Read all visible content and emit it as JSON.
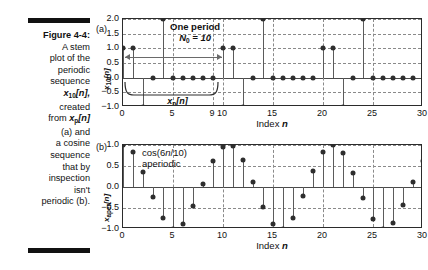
{
  "figure": {
    "caption_label": "Figure 4-4:",
    "caption_text": "A stem plot of the periodic sequence x10[n], created from xp[n] (a) and a cosine sequence that by inspection isn't periodic (b).",
    "caption_lines": [
      "A stem",
      "plot of the",
      "periodic",
      "sequence",
      "created",
      "(a) and",
      "a cosine",
      "sequence",
      "that by",
      "inspection",
      "isn't",
      "periodic (b)."
    ],
    "rule_color": "#111111"
  },
  "panel_a": {
    "tag": "(a)",
    "ylabel": "x10[n]",
    "ylabel_base": "x",
    "ylabel_sub": "10",
    "ylabel_tail": "[n]",
    "annotation_line1": "One period",
    "annotation_line2_base": "N",
    "annotation_line2_sub": "0",
    "annotation_line2_tail": " = 10",
    "brace_label_base": "x",
    "brace_label_sub": "p",
    "brace_label_tail": "[n]",
    "xaxis_title": "Index n"
  },
  "panel_b": {
    "tag": "(b)",
    "ylabel": "xaper[n]",
    "ylabel_base": "x",
    "ylabel_sub": "aper",
    "ylabel_tail": "[n]",
    "annotation_line1": "cos(6n/10)",
    "annotation_line2": "aperiodic",
    "xaxis_title": "Index n"
  },
  "chart_data": [
    {
      "type": "stem",
      "id": "panel-a",
      "title": "",
      "xlabel": "Index n",
      "ylabel": "x10[n]",
      "xlim": [
        0,
        30
      ],
      "ylim": [
        -1.0,
        2.0
      ],
      "grid": true,
      "xticks": [
        0,
        5,
        9,
        10,
        15,
        20,
        25,
        30
      ],
      "xticklabels": [
        "0",
        "5",
        "9",
        "10",
        "15",
        "20",
        "25",
        "30"
      ],
      "yticks": [
        -1.0,
        -0.5,
        0.0,
        0.5,
        1.0,
        1.5,
        2.0
      ],
      "yticklabels": [
        "-1.0",
        "-0.5",
        "0.0",
        "0.5",
        "1.0",
        "1.5",
        "2.0"
      ],
      "period": 10,
      "one_period_span": [
        0,
        9
      ],
      "annotations": [
        "One period",
        "N0 = 10",
        "xp[n]"
      ],
      "x": [
        0,
        1,
        2,
        3,
        4,
        5,
        6,
        7,
        8,
        9,
        10,
        11,
        12,
        13,
        14,
        15,
        16,
        17,
        18,
        19,
        20,
        21,
        22,
        23,
        24,
        25,
        26,
        27,
        28,
        29
      ],
      "values": [
        1.0,
        1.0,
        -1.0,
        0.0,
        2.0,
        0.0,
        0.0,
        0.0,
        0.0,
        0.0,
        1.0,
        1.0,
        -1.0,
        0.0,
        2.0,
        0.0,
        0.0,
        0.0,
        0.0,
        0.0,
        1.0,
        1.0,
        -1.0,
        0.0,
        2.0,
        0.0,
        0.0,
        0.0,
        0.0,
        0.0
      ]
    },
    {
      "type": "stem",
      "id": "panel-b",
      "title": "",
      "xlabel": "Index n",
      "ylabel": "xaper[n]",
      "xlim": [
        0,
        30
      ],
      "ylim": [
        -1.0,
        1.0
      ],
      "grid": true,
      "xticks": [
        0,
        5,
        10,
        15,
        20,
        25,
        30
      ],
      "xticklabels": [
        "0",
        "5",
        "10",
        "15",
        "20",
        "25",
        "30"
      ],
      "yticks": [
        -1.0,
        -0.5,
        0.0,
        0.5,
        1.0
      ],
      "yticklabels": [
        "-1.0",
        "-0.5",
        "0.0",
        "0.5",
        "1.0"
      ],
      "expression": "cos(6n/10)",
      "annotations": [
        "cos(6n/10)",
        "aperiodic"
      ],
      "x": [
        0,
        1,
        2,
        3,
        4,
        5,
        6,
        7,
        8,
        9,
        10,
        11,
        12,
        13,
        14,
        15,
        16,
        17,
        18,
        19,
        20,
        21,
        22,
        23,
        24,
        25,
        26,
        27,
        28,
        29,
        30
      ],
      "values": [
        1.0,
        0.83,
        0.36,
        -0.23,
        -0.74,
        -0.99,
        -0.88,
        -0.46,
        0.08,
        0.61,
        0.96,
        0.98,
        0.64,
        0.11,
        -0.48,
        -0.88,
        -1.0,
        -0.73,
        -0.21,
        0.37,
        0.84,
        1.0,
        0.81,
        0.33,
        -0.26,
        -0.76,
        -0.99,
        -0.86,
        -0.44,
        0.11,
        0.63
      ]
    }
  ]
}
